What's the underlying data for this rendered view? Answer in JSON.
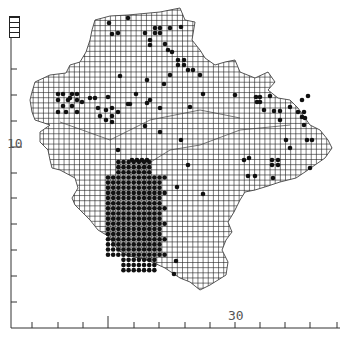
{
  "map": {
    "title": "",
    "grid_cell_px": 5.15,
    "axis": {
      "left_label": "10",
      "bottom_label": "30",
      "left_ticks_y": [
        32,
        69,
        95,
        121,
        147,
        173,
        198,
        224,
        250,
        276,
        302
      ],
      "bottom_ticks_x": [
        32,
        58,
        83,
        108,
        134,
        159,
        185,
        210,
        235,
        260,
        285,
        310,
        337
      ]
    },
    "colors": {
      "grid": "#222222",
      "dot": "#111111",
      "axis": "#333333",
      "coast": "#444444"
    },
    "outline": [
      [
        128,
        15
      ],
      [
        160,
        12
      ],
      [
        180,
        8
      ],
      [
        185,
        20
      ],
      [
        195,
        22
      ],
      [
        192,
        40
      ],
      [
        200,
        50
      ],
      [
        205,
        58
      ],
      [
        215,
        65
      ],
      [
        225,
        62
      ],
      [
        235,
        60
      ],
      [
        240,
        72
      ],
      [
        255,
        78
      ],
      [
        268,
        72
      ],
      [
        275,
        82
      ],
      [
        268,
        90
      ],
      [
        278,
        98
      ],
      [
        290,
        100
      ],
      [
        298,
        108
      ],
      [
        310,
        125
      ],
      [
        320,
        130
      ],
      [
        328,
        140
      ],
      [
        332,
        148
      ],
      [
        325,
        158
      ],
      [
        315,
        165
      ],
      [
        305,
        172
      ],
      [
        296,
        178
      ],
      [
        280,
        182
      ],
      [
        268,
        186
      ],
      [
        255,
        190
      ],
      [
        245,
        192
      ],
      [
        240,
        200
      ],
      [
        234,
        212
      ],
      [
        228,
        222
      ],
      [
        232,
        232
      ],
      [
        226,
        240
      ],
      [
        222,
        250
      ],
      [
        228,
        262
      ],
      [
        226,
        275
      ],
      [
        210,
        285
      ],
      [
        200,
        290
      ],
      [
        190,
        282
      ],
      [
        180,
        278
      ],
      [
        165,
        268
      ],
      [
        152,
        262
      ],
      [
        140,
        258
      ],
      [
        128,
        256
      ],
      [
        118,
        250
      ],
      [
        108,
        236
      ],
      [
        98,
        230
      ],
      [
        90,
        220
      ],
      [
        80,
        210
      ],
      [
        75,
        205
      ],
      [
        72,
        198
      ],
      [
        78,
        188
      ],
      [
        75,
        178
      ],
      [
        60,
        170
      ],
      [
        52,
        168
      ],
      [
        50,
        160
      ],
      [
        48,
        150
      ],
      [
        40,
        142
      ],
      [
        40,
        132
      ],
      [
        50,
        125
      ],
      [
        35,
        120
      ],
      [
        32,
        112
      ],
      [
        30,
        100
      ],
      [
        32,
        92
      ],
      [
        35,
        82
      ],
      [
        50,
        75
      ],
      [
        66,
        73
      ],
      [
        70,
        65
      ],
      [
        80,
        62
      ],
      [
        86,
        52
      ],
      [
        90,
        40
      ],
      [
        92,
        30
      ],
      [
        95,
        20
      ],
      [
        110,
        16
      ]
    ],
    "dots": [
      [
        109,
        23
      ],
      [
        128,
        18
      ],
      [
        118,
        33
      ],
      [
        112,
        34
      ],
      [
        145,
        33
      ],
      [
        155,
        28
      ],
      [
        160,
        28
      ],
      [
        155,
        33
      ],
      [
        160,
        33
      ],
      [
        170,
        28
      ],
      [
        181,
        27
      ],
      [
        150,
        40
      ],
      [
        150,
        45
      ],
      [
        165,
        44
      ],
      [
        168,
        50
      ],
      [
        172,
        52
      ],
      [
        178,
        60
      ],
      [
        178,
        65
      ],
      [
        184,
        60
      ],
      [
        184,
        65
      ],
      [
        188,
        70
      ],
      [
        193,
        70
      ],
      [
        200,
        75
      ],
      [
        170,
        75
      ],
      [
        58,
        94
      ],
      [
        63,
        94
      ],
      [
        72,
        94
      ],
      [
        77,
        94
      ],
      [
        58,
        100
      ],
      [
        68,
        100
      ],
      [
        77,
        100
      ],
      [
        63,
        106
      ],
      [
        72,
        106
      ],
      [
        58,
        112
      ],
      [
        66,
        112
      ],
      [
        77,
        112
      ],
      [
        70,
        98
      ],
      [
        90,
        98
      ],
      [
        95,
        98
      ],
      [
        82,
        102
      ],
      [
        98,
        108
      ],
      [
        106,
        110
      ],
      [
        112,
        108
      ],
      [
        100,
        116
      ],
      [
        106,
        120
      ],
      [
        112,
        116
      ],
      [
        118,
        112
      ],
      [
        112,
        122
      ],
      [
        108,
        97
      ],
      [
        136,
        94
      ],
      [
        130,
        104
      ],
      [
        150,
        100
      ],
      [
        160,
        108
      ],
      [
        190,
        107
      ],
      [
        235,
        95
      ],
      [
        256,
        97
      ],
      [
        260,
        97
      ],
      [
        257,
        102
      ],
      [
        260,
        102
      ],
      [
        270,
        96
      ],
      [
        264,
        110
      ],
      [
        274,
        111
      ],
      [
        280,
        111
      ],
      [
        298,
        112
      ],
      [
        304,
        112
      ],
      [
        302,
        100
      ],
      [
        308,
        96
      ],
      [
        290,
        107
      ],
      [
        302,
        117
      ],
      [
        304,
        125
      ],
      [
        305,
        118
      ],
      [
        280,
        120
      ],
      [
        286,
        140
      ],
      [
        290,
        148
      ],
      [
        307,
        140
      ],
      [
        312,
        140
      ],
      [
        272,
        160
      ],
      [
        278,
        160
      ],
      [
        272,
        165
      ],
      [
        278,
        165
      ],
      [
        244,
        160
      ],
      [
        249,
        158
      ],
      [
        273,
        178
      ],
      [
        248,
        176
      ],
      [
        255,
        176
      ],
      [
        310,
        168
      ],
      [
        128,
        104
      ],
      [
        145,
        126
      ],
      [
        160,
        132
      ],
      [
        181,
        140
      ],
      [
        118,
        150
      ],
      [
        147,
        103
      ],
      [
        120,
        76
      ],
      [
        147,
        80
      ],
      [
        164,
        84
      ],
      [
        203,
        94
      ],
      [
        132,
        160
      ],
      [
        137,
        160
      ],
      [
        142,
        160
      ],
      [
        147,
        160
      ],
      [
        188,
        165
      ],
      [
        177,
        187
      ],
      [
        203,
        194
      ],
      [
        176,
        261
      ],
      [
        174,
        274
      ]
    ],
    "dense_block": {
      "x0": 108,
      "y0": 162,
      "cols": 12,
      "rows": 22,
      "cell": 5.15
    }
  }
}
